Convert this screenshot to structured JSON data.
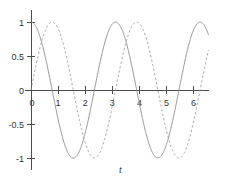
{
  "chart_data": {
    "type": "line",
    "title": "",
    "subtitle": "",
    "xlabel": "t",
    "ylabel": "",
    "xlim": [
      -0.22,
      6.55
    ],
    "ylim": [
      -1.18,
      1.18
    ],
    "grid": false,
    "legend": null,
    "xticks": [
      0,
      1,
      2,
      3,
      4,
      5,
      6
    ],
    "xtick_labels": [
      "0",
      "1",
      "2",
      "3",
      "4",
      "5",
      "6"
    ],
    "yticks": [
      -1,
      -0.5,
      0,
      0.5,
      1
    ],
    "ytick_labels": [
      "-1",
      "-0.5",
      "0",
      "0.5",
      "1"
    ],
    "series": [
      {
        "name": "solid-curve",
        "style": "solid",
        "color": "#8a8a8a",
        "amplitude": 1,
        "period": 3.12,
        "phase_deg": 0,
        "description": "cosine wave starting at 1 at t=0",
        "x": [
          0,
          0.16,
          0.31,
          0.47,
          0.62,
          0.78,
          0.94,
          1.09,
          1.25,
          1.4,
          1.56,
          1.72,
          1.87,
          2.03,
          2.18,
          2.34,
          2.5,
          2.65,
          2.81,
          2.96,
          3.12,
          3.28,
          3.43,
          3.59,
          3.74,
          3.9,
          4.06,
          4.21,
          4.37,
          4.52,
          4.68,
          4.84,
          4.99,
          5.15,
          5.3,
          5.46,
          5.62,
          5.77,
          5.93,
          6.08,
          6.24,
          6.4
        ],
        "y": [
          1,
          0.951,
          0.809,
          0.588,
          0.309,
          0,
          -0.309,
          -0.588,
          -0.809,
          -0.951,
          -1,
          -0.951,
          -0.809,
          -0.588,
          -0.309,
          0,
          0.309,
          0.588,
          0.809,
          0.951,
          1,
          0.951,
          0.809,
          0.588,
          0.309,
          0,
          -0.309,
          -0.588,
          -0.809,
          -0.951,
          -1,
          -0.951,
          -0.809,
          -0.588,
          -0.309,
          0,
          0.309,
          0.588,
          0.809,
          0.951,
          1,
          0.951
        ]
      },
      {
        "name": "dashed-curve",
        "style": "dashed",
        "color": "#9a9a9a",
        "amplitude": 1,
        "period": 3.12,
        "phase_deg": -90,
        "description": "sine wave starting at 0 at t=0 rising",
        "x": [
          0,
          0.16,
          0.31,
          0.47,
          0.62,
          0.78,
          0.94,
          1.09,
          1.25,
          1.4,
          1.56,
          1.72,
          1.87,
          2.03,
          2.18,
          2.34,
          2.5,
          2.65,
          2.81,
          2.96,
          3.12,
          3.28,
          3.43,
          3.59,
          3.74,
          3.9,
          4.06,
          4.21,
          4.37,
          4.52,
          4.68,
          4.84,
          4.99,
          5.15,
          5.3,
          5.46,
          5.62,
          5.77,
          5.93,
          6.08,
          6.24,
          6.4
        ],
        "y": [
          0,
          0.309,
          0.588,
          0.809,
          0.951,
          1,
          0.951,
          0.809,
          0.588,
          0.309,
          0,
          -0.309,
          -0.588,
          -0.809,
          -0.951,
          -1,
          -0.951,
          -0.809,
          -0.588,
          -0.309,
          0,
          0.309,
          0.588,
          0.809,
          0.951,
          1,
          0.951,
          0.809,
          0.588,
          0.309,
          0,
          -0.309,
          -0.588,
          -0.809,
          -0.951,
          -1,
          -0.951,
          -0.809,
          -0.588,
          -0.309,
          0,
          0.309
        ]
      }
    ]
  }
}
